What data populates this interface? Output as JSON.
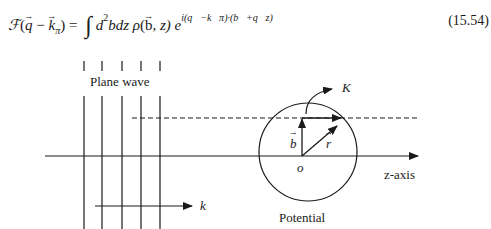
{
  "equation": {
    "lhs_func": "ℱ",
    "lhs_arg_q": "q",
    "lhs_minus": "−",
    "lhs_arg_k": "k",
    "lhs_arg_k_sub": "π",
    "equals": "=",
    "integral": "∫",
    "measure_d": "d",
    "measure_sup": "2",
    "measure_rest": "bdz",
    "density": "ρ",
    "density_b": "b",
    "density_z": ", z)",
    "exp_base": "e",
    "exp_text": "i(q⃗−k⃗π)·(b⃗+q⃗z)",
    "number": "(15.54)"
  },
  "diagram": {
    "plane_wave_label": "Plane wave",
    "k_label": "k",
    "K_label": "K",
    "b_label": "b",
    "r_label": "r",
    "origin_label": "o",
    "axis_label": "z-axis",
    "potential_label": "Potential",
    "wavefront_x": [
      84,
      102,
      122,
      141,
      160
    ]
  }
}
